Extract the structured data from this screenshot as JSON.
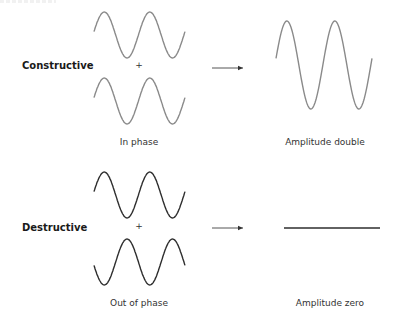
{
  "diagram": {
    "rows": [
      {
        "id": "constructive",
        "row_label": "Constructive",
        "operator": "+",
        "input_label": "In phase",
        "result_label": "Amplitude double",
        "wave_color": "#8a8a8a",
        "input_waves": [
          {
            "name": "wave-a",
            "cycles": 2,
            "amplitude": 1,
            "phase_deg": 0
          },
          {
            "name": "wave-b",
            "cycles": 2,
            "amplitude": 1,
            "phase_deg": 0
          }
        ],
        "result_wave": {
          "cycles": 2,
          "amplitude": 2,
          "phase_deg": 0
        }
      },
      {
        "id": "destructive",
        "row_label": "Destructive",
        "operator": "+",
        "input_label": "Out of phase",
        "result_label": "Amplitude zero",
        "wave_color": "#2e2e2e",
        "input_waves": [
          {
            "name": "wave-a",
            "cycles": 2,
            "amplitude": 1,
            "phase_deg": 0
          },
          {
            "name": "wave-b",
            "cycles": 2,
            "amplitude": 1,
            "phase_deg": 180
          }
        ],
        "result_wave": {
          "cycles": 2,
          "amplitude": 0,
          "phase_deg": 0
        }
      }
    ]
  }
}
